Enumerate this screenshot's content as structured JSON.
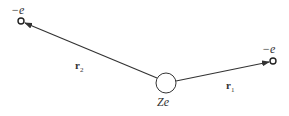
{
  "diagram": {
    "nucleus": {
      "label": "Ze",
      "cx": 166,
      "cy": 83,
      "r": 10
    },
    "electron1": {
      "label": "−e",
      "cx": 273,
      "cy": 61
    },
    "electron2": {
      "label": "−e",
      "cx": 21,
      "cy": 21
    },
    "vector1": {
      "symbol": "r",
      "subscript": "1"
    },
    "vector2": {
      "symbol": "r",
      "subscript": "2"
    },
    "colors": {
      "stroke": "#333333",
      "background": "#ffffff"
    }
  }
}
